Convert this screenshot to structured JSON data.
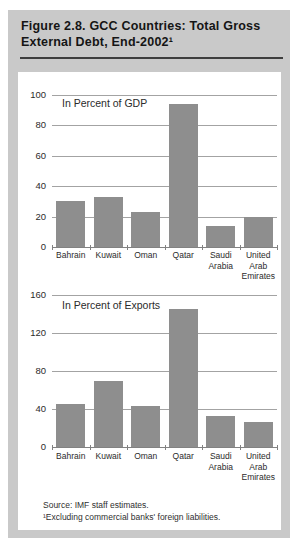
{
  "figure": {
    "title": "Figure 2.8. GCC Countries: Total Gross External Debt, End-2002¹",
    "source": "Source: IMF staff estimates.",
    "footnote": "¹Excluding commercial banks' foreign liabilities."
  },
  "colors": {
    "frame_bg": "#c9c9c9",
    "panel_bg": "#ffffff",
    "bar": "#8e8e8e",
    "gridline": "#a3a3a3",
    "baseline": "#828282",
    "title_rule": "#3e3e3e",
    "text": "#2b2b2b"
  },
  "chart_data": [
    {
      "type": "bar",
      "title": "In Percent of GDP",
      "categories": [
        "Bahrain",
        "Kuwait",
        "Oman",
        "Qatar",
        "Saudi Arabia",
        "United Arab Emirates"
      ],
      "values": [
        30,
        33,
        23,
        94,
        14,
        20
      ],
      "xlabel": "",
      "ylabel": "",
      "ylim": [
        0,
        100
      ],
      "yticks": [
        0,
        20,
        40,
        60,
        80,
        100
      ],
      "grid": true,
      "legend": false,
      "bar_color": "#8e8e8e"
    },
    {
      "type": "bar",
      "title": "In Percent of Exports",
      "categories": [
        "Bahrain",
        "Kuwait",
        "Oman",
        "Qatar",
        "Saudi Arabia",
        "United Arab Emirates"
      ],
      "values": [
        45,
        70,
        43,
        145,
        33,
        26
      ],
      "xlabel": "",
      "ylabel": "",
      "ylim": [
        0,
        160
      ],
      "yticks": [
        0,
        40,
        80,
        120,
        160
      ],
      "grid": true,
      "legend": false,
      "bar_color": "#8e8e8e"
    }
  ]
}
